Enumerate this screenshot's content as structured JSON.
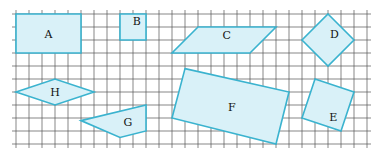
{
  "diagram": {
    "title": "",
    "grid": {
      "columns": 27,
      "rows": 10
    },
    "colors": {
      "fill": "#d9f1f8",
      "stroke": "#3ab3cf",
      "grid": "#555555"
    },
    "shapes": [
      {
        "label": "A",
        "kind": "rectangle",
        "vertices": [
          [
            0,
            0
          ],
          [
            5,
            0
          ],
          [
            5,
            3
          ],
          [
            0,
            3
          ]
        ],
        "label_at": [
          2.5,
          1.6
        ]
      },
      {
        "label": "B",
        "kind": "square",
        "vertices": [
          [
            8,
            0
          ],
          [
            10,
            0
          ],
          [
            10,
            2
          ],
          [
            8,
            2
          ]
        ],
        "label_at": [
          9.3,
          0.6
        ]
      },
      {
        "label": "C",
        "kind": "parallelogram",
        "vertices": [
          [
            14,
            1
          ],
          [
            20,
            1
          ],
          [
            18,
            3
          ],
          [
            12,
            3
          ]
        ],
        "label_at": [
          16.2,
          1.7
        ]
      },
      {
        "label": "D",
        "kind": "square",
        "vertices": [
          [
            24,
            0
          ],
          [
            26,
            2
          ],
          [
            24,
            4
          ],
          [
            22,
            2
          ]
        ],
        "label_at": [
          24.5,
          1.6
        ]
      },
      {
        "label": "H",
        "kind": "rhombus",
        "vertices": [
          [
            0,
            6
          ],
          [
            3,
            5
          ],
          [
            6,
            6
          ],
          [
            3,
            7
          ]
        ],
        "label_at": [
          3,
          6.1
        ]
      },
      {
        "label": "G",
        "kind": "quadrilateral",
        "vertices": [
          [
            5,
            8.2
          ],
          [
            10,
            7
          ],
          [
            10,
            9
          ],
          [
            8,
            9.5
          ]
        ],
        "label_at": [
          8.6,
          8.4
        ]
      },
      {
        "label": "F",
        "kind": "rectangle",
        "vertices": [
          [
            13,
            4.2
          ],
          [
            21,
            6
          ],
          [
            20,
            10
          ],
          [
            12,
            8
          ]
        ],
        "label_at": [
          16.6,
          7.2
        ]
      },
      {
        "label": "E",
        "kind": "square",
        "vertices": [
          [
            23,
            5
          ],
          [
            26,
            6
          ],
          [
            25,
            9
          ],
          [
            22,
            8
          ]
        ],
        "label_at": [
          24.4,
          8
        ]
      }
    ]
  }
}
